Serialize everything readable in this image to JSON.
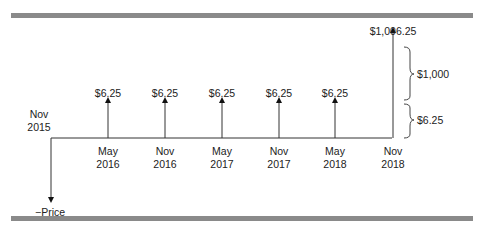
{
  "diagram": {
    "start": {
      "label_line1": "Nov",
      "label_line2": "2015"
    },
    "initial_flow_label": "−Price",
    "periods": [
      {
        "month": "May",
        "year": "2016",
        "cash_flow": "$6.25"
      },
      {
        "month": "Nov",
        "year": "2016",
        "cash_flow": "$6.25"
      },
      {
        "month": "May",
        "year": "2017",
        "cash_flow": "$6.25"
      },
      {
        "month": "Nov",
        "year": "2017",
        "cash_flow": "$6.25"
      },
      {
        "month": "May",
        "year": "2018",
        "cash_flow": "$6.25"
      },
      {
        "month": "Nov",
        "year": "2018",
        "cash_flow": "$1,006.25"
      }
    ],
    "brackets": [
      {
        "label": "$1,000"
      },
      {
        "label": "$6.25"
      }
    ]
  }
}
